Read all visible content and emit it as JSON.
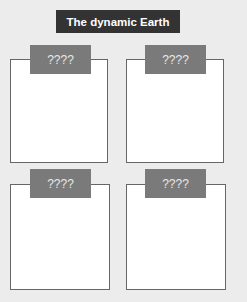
{
  "title": "The dynamic Earth",
  "panels": [
    {
      "label": "????"
    },
    {
      "label": "????"
    },
    {
      "label": "????"
    },
    {
      "label": "????"
    }
  ],
  "colors": {
    "background": "#ececec",
    "title_bg": "#333333",
    "label_bg": "#7a7a7a",
    "box_border": "#666666"
  }
}
